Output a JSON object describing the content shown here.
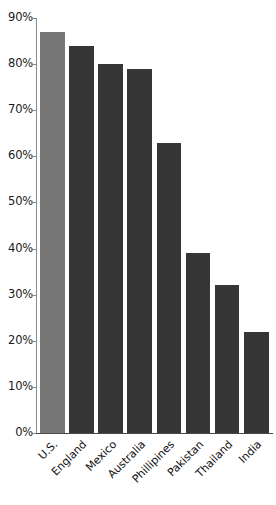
{
  "chart_data": {
    "type": "bar",
    "title": "",
    "subtitle": "",
    "xlabel": "",
    "ylabel": "",
    "categories": [
      "U.S.",
      "England",
      "Mexico",
      "Australia",
      "Phillipines",
      "Pakistan",
      "Thailand",
      "India"
    ],
    "values": [
      87,
      84,
      80,
      79,
      63,
      39,
      32,
      22
    ],
    "value_suffix": "%",
    "ylim": [
      0,
      90
    ],
    "ytick_values": [
      0,
      10,
      20,
      30,
      40,
      50,
      60,
      70,
      80,
      90
    ],
    "ytick_labels": [
      "0%",
      "10%",
      "20%",
      "30%",
      "40%",
      "50%",
      "60%",
      "70%",
      "80%",
      "90%"
    ],
    "grid": false,
    "legend": "none",
    "bar_colors": [
      "#767676",
      "#363636",
      "#363636",
      "#363636",
      "#363636",
      "#363636",
      "#363636",
      "#363636"
    ],
    "highlight_index": 0,
    "axis_color": "#8a8a8a",
    "baseline_color": "#4a4a4a",
    "background_color": "#ffffff",
    "label_color": "#111111"
  }
}
